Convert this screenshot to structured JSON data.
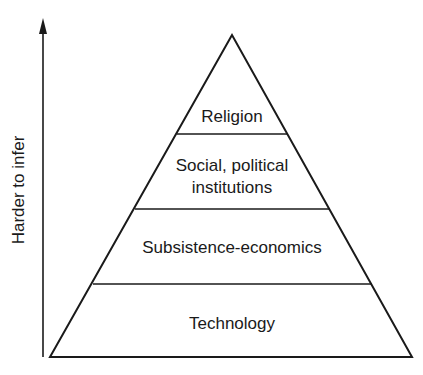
{
  "axis": {
    "label": "Harder to infer",
    "direction": "up"
  },
  "pyramid": {
    "levels": [
      {
        "label": "Religion",
        "position": "top"
      },
      {
        "label": "Social, political institutions",
        "line1": "Social, political",
        "line2": "institutions",
        "position": "second"
      },
      {
        "label": "Subsistence-economics",
        "position": "third"
      },
      {
        "label": "Technology",
        "position": "base"
      }
    ]
  },
  "colors": {
    "stroke": "#1a1a1a",
    "background": "#ffffff"
  }
}
